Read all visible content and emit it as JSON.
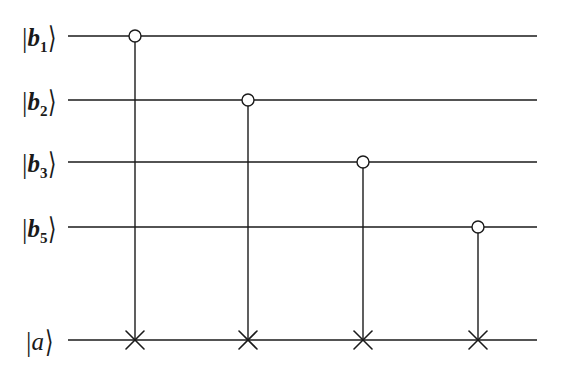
{
  "figure": {
    "kind": "quantum-circuit-diagram",
    "background_color": "#ffffff",
    "ink_color": "#1a1a1a",
    "width": 563,
    "height": 374
  },
  "wires": [
    {
      "id": "b1",
      "label_prefix": "|",
      "symbol": "b",
      "subscript": "1",
      "label_suffix": "⟩",
      "label_text": "|b₁⟩",
      "y": 36,
      "x_start": 68,
      "x_end": 537
    },
    {
      "id": "b2",
      "label_prefix": "|",
      "symbol": "b",
      "subscript": "2",
      "label_suffix": "⟩",
      "label_text": "|b₂⟩",
      "y": 100,
      "x_start": 68,
      "x_end": 537
    },
    {
      "id": "b3",
      "label_prefix": "|",
      "symbol": "b",
      "subscript": "3",
      "label_suffix": "⟩",
      "label_text": "|b₃⟩",
      "y": 162,
      "x_start": 68,
      "x_end": 537
    },
    {
      "id": "b5",
      "label_prefix": "|",
      "symbol": "b",
      "subscript": "5",
      "label_suffix": "⟩",
      "label_text": "|b₅⟩",
      "y": 227,
      "x_start": 68,
      "x_end": 537
    },
    {
      "id": "a",
      "label_prefix": "|",
      "symbol": "a",
      "subscript": "",
      "label_suffix": "⟩",
      "label_text": "|a⟩",
      "y": 340,
      "x_start": 68,
      "x_end": 537
    }
  ],
  "label_positions": [
    {
      "wire": "b1",
      "x": 22,
      "y": 36
    },
    {
      "wire": "b2",
      "x": 22,
      "y": 100
    },
    {
      "wire": "b3",
      "x": 22,
      "y": 162
    },
    {
      "wire": "b5",
      "x": 22,
      "y": 227
    },
    {
      "wire": "a",
      "x": 26,
      "y": 340
    }
  ],
  "gates": [
    {
      "index": 1,
      "type": "controlled-not",
      "control_wire": "b1",
      "target_wire": "a",
      "x": 135,
      "control_y": 36,
      "target_y": 340,
      "control_symbol": "open-circle",
      "target_symbol": "cross",
      "control_radius": 6
    },
    {
      "index": 2,
      "type": "controlled-not",
      "control_wire": "b2",
      "target_wire": "a",
      "x": 248,
      "control_y": 100,
      "target_y": 340,
      "control_symbol": "open-circle",
      "target_symbol": "cross",
      "control_radius": 6
    },
    {
      "index": 3,
      "type": "controlled-not",
      "control_wire": "b3",
      "target_wire": "a",
      "x": 363,
      "control_y": 162,
      "target_y": 340,
      "control_symbol": "open-circle",
      "target_symbol": "cross",
      "control_radius": 6
    },
    {
      "index": 4,
      "type": "controlled-not",
      "control_wire": "b5",
      "target_wire": "a",
      "x": 478,
      "control_y": 227,
      "target_y": 340,
      "control_symbol": "open-circle",
      "target_symbol": "cross",
      "control_radius": 6
    }
  ],
  "style": {
    "wire_stroke_width": 1.6,
    "connector_stroke_width": 1.4,
    "circle_stroke_width": 1.4,
    "cross_stroke_width": 1.6,
    "cross_arm_half_length": 9,
    "circle_fill": "#ffffff"
  }
}
